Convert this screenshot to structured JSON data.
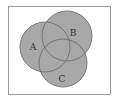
{
  "diagram": {
    "type": "venn",
    "universe": {
      "x": 8,
      "y": 6,
      "width": 103,
      "height": 89,
      "stroke": "#9a9a9a",
      "fill": "#ffffff"
    },
    "sets": [
      {
        "id": "A",
        "label": "A",
        "cx": 45,
        "cy": 47,
        "r": 25,
        "label_x": 33,
        "label_y": 47
      },
      {
        "id": "B",
        "label": "B",
        "cx": 67,
        "cy": 36,
        "r": 25,
        "label_x": 73,
        "label_y": 33
      },
      {
        "id": "C",
        "label": "C",
        "cx": 63,
        "cy": 63,
        "r": 24,
        "label_x": 62,
        "label_y": 79
      }
    ],
    "fill_color": "#a8a8a8",
    "stroke_color": "#6e6e6e"
  }
}
